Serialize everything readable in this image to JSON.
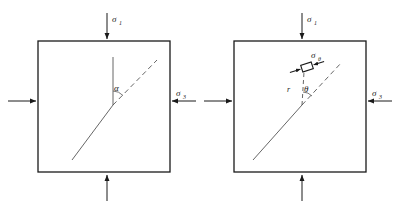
{
  "figure": {
    "type": "diagram",
    "background_color": "#ffffff",
    "line_color": "#1a1a1a",
    "panels": [
      {
        "id": "left",
        "name": "crack-inclination-panel",
        "box": {
          "x": 38,
          "y": 41,
          "width": 132,
          "height": 131
        },
        "labels": {
          "sigma_top": "σ",
          "sigma_top_sub": "1",
          "sigma_bottom": "σ",
          "sigma_bottom_sub": "1",
          "sigma_side": "σ",
          "sigma_side_sub": "3",
          "angle": "α"
        },
        "crack": {
          "x1": 72,
          "y1": 160,
          "x2": 113,
          "y2": 105
        },
        "reference_line": {
          "x1": 113,
          "y1": 105,
          "x2": 113,
          "y2": 57
        },
        "dashed_extension": {
          "x1": 113,
          "y1": 105,
          "x2": 157,
          "y2": 60
        }
      },
      {
        "id": "right",
        "name": "polar-coordinates-panel",
        "box": {
          "x": 234,
          "y": 41,
          "width": 132,
          "height": 131
        },
        "labels": {
          "sigma_top": "σ",
          "sigma_top_sub": "1",
          "sigma_bottom": "σ",
          "sigma_bottom_sub": "1",
          "sigma_side": "σ",
          "sigma_side_sub": "3",
          "hoop_stress": "σ",
          "hoop_stress_sub": "θ",
          "radius": "r",
          "angle": "θ"
        },
        "crack": {
          "x1": 253,
          "y1": 160,
          "x2": 302,
          "y2": 105
        },
        "radial_line": {
          "x1": 302,
          "y1": 105,
          "x2": 303,
          "y2": 70
        },
        "dashed_extension": {
          "x1": 302,
          "y1": 105,
          "x2": 340,
          "y2": 62
        },
        "element": {
          "cx": 307,
          "cy": 67,
          "width": 11,
          "height": 7,
          "rotation": -18
        }
      }
    ],
    "arrows": {
      "sigma_1_direction": "vertical-inward",
      "sigma_3_direction": "horizontal-inward",
      "hoop_direction": "horizontal-inward"
    }
  }
}
